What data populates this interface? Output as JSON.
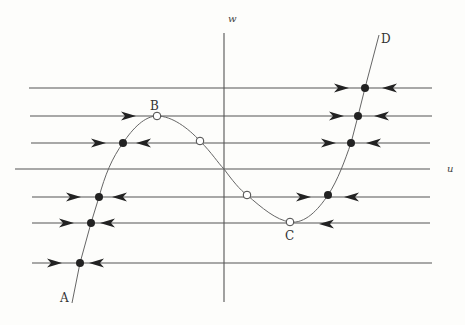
{
  "diagram": {
    "type": "phase-plane",
    "axes": {
      "u": {
        "label": "u",
        "y": 169,
        "x1": 15,
        "x2": 430,
        "label_x": 447,
        "label_y": 172
      },
      "w": {
        "label": "w",
        "x": 224,
        "y1": 33,
        "y2": 302,
        "label_x": 228,
        "label_y": 22
      }
    },
    "colors": {
      "line": "#555555",
      "curve": "#666666",
      "fill": "#222222",
      "open_fill": "#ffffff"
    },
    "horizontal_lines": [
      {
        "y": 88,
        "x1": 29,
        "x2": 432
      },
      {
        "y": 116,
        "x1": 30,
        "x2": 432
      },
      {
        "y": 143,
        "x1": 31,
        "x2": 430
      },
      {
        "y": 197,
        "x1": 32,
        "x2": 430
      },
      {
        "y": 223,
        "x1": 32,
        "x2": 430
      },
      {
        "y": 263,
        "x1": 32,
        "x2": 432
      }
    ],
    "curve_labels": [
      {
        "text": "A",
        "x": 60,
        "y": 302
      },
      {
        "text": "B",
        "x": 150,
        "y": 110
      },
      {
        "text": "C",
        "x": 285,
        "y": 240
      },
      {
        "text": "D",
        "x": 381,
        "y": 43
      }
    ],
    "stable_points": [
      {
        "x": 365,
        "y": 88
      },
      {
        "x": 358,
        "y": 116
      },
      {
        "x": 351,
        "y": 143
      },
      {
        "x": 123,
        "y": 143
      },
      {
        "x": 99,
        "y": 197
      },
      {
        "x": 91,
        "y": 223
      },
      {
        "x": 80,
        "y": 263
      },
      {
        "x": 328,
        "y": 195
      }
    ],
    "unstable_points": [
      {
        "x": 157,
        "y": 116
      },
      {
        "x": 200,
        "y": 141
      },
      {
        "x": 247,
        "y": 195
      },
      {
        "x": 290,
        "y": 222
      }
    ],
    "arrows_right": [
      {
        "x": 343,
        "y": 88
      },
      {
        "x": 338,
        "y": 116
      },
      {
        "x": 330,
        "y": 143
      },
      {
        "x": 130,
        "y": 116
      },
      {
        "x": 100,
        "y": 143
      },
      {
        "x": 75,
        "y": 197
      },
      {
        "x": 68,
        "y": 223
      },
      {
        "x": 56,
        "y": 263
      },
      {
        "x": 305,
        "y": 197
      }
    ],
    "arrows_left": [
      {
        "x": 388,
        "y": 88
      },
      {
        "x": 380,
        "y": 116
      },
      {
        "x": 372,
        "y": 143
      },
      {
        "x": 142,
        "y": 143
      },
      {
        "x": 118,
        "y": 197
      },
      {
        "x": 106,
        "y": 223
      },
      {
        "x": 95,
        "y": 263
      },
      {
        "x": 350,
        "y": 197
      },
      {
        "x": 325,
        "y": 224
      }
    ],
    "curve_path": "M 72 303 L 80 263 L 91 223 L 99 197 C 105 175, 112 158, 123 143 C 133 128, 145 116, 157 116 C 172 116, 188 128, 200 141 C 212 153, 218 163, 224 169 C 232 180, 240 190, 247 195 C 262 208, 276 220, 290 222 C 305 224, 318 210, 328 195 C 338 180, 345 160, 351 143 L 358 116 L 365 88 L 379 35"
  }
}
